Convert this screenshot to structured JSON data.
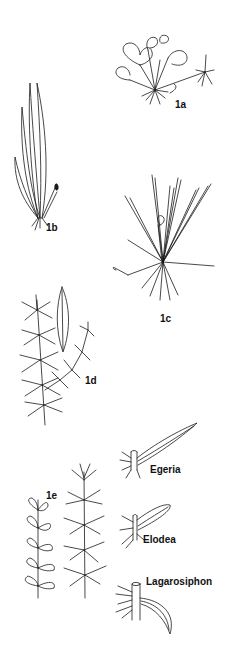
{
  "figure": {
    "colors": {
      "ink": "#1a1a1a",
      "background": "#ffffff"
    },
    "panels": [
      {
        "id": "1a",
        "label": "1a",
        "depicts": "rosette plant with round floating leaves and runner"
      },
      {
        "id": "1b",
        "label": "1b",
        "depicts": "plant with long strap-shaped leaves"
      },
      {
        "id": "1c",
        "label": "1c",
        "depicts": "grass-like rosette plant"
      },
      {
        "id": "1d",
        "label": "1d",
        "depicts": "whorled-leaf stem with detail of single leaf"
      },
      {
        "id": "1e",
        "label": "1e",
        "depicts": "two leafy submerged stems"
      }
    ],
    "leaf_details": [
      {
        "label": "Egeria"
      },
      {
        "label": "Elodea"
      },
      {
        "label": "Lagarosiphon"
      }
    ]
  }
}
